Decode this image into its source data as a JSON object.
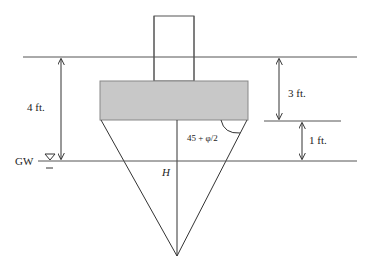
{
  "diagram": {
    "colors": {
      "line": "#333333",
      "footing_fill": "#c8c8c8",
      "footing_stroke": "#888888",
      "background": "#ffffff"
    },
    "labels": {
      "depth_total": "4 ft.",
      "depth_footing": "3 ft.",
      "depth_below_footing": "1 ft.",
      "groundwater": "GW",
      "wedge_height": "H",
      "wedge_angle": "45 + φ/2"
    },
    "symbols": {
      "water_table": "▽"
    },
    "elements": {
      "column": "column",
      "footing": "footing",
      "ground_surface": "ground-surface",
      "groundwater_line": "groundwater-line",
      "failure_wedge": "failure-wedge"
    }
  }
}
